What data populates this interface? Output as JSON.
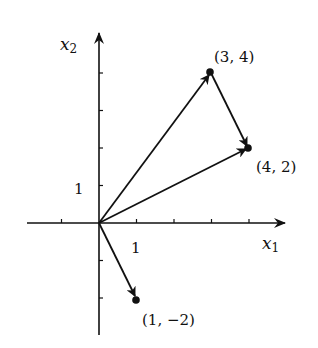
{
  "figure": {
    "axes": {
      "x_label": "x",
      "x_sub": "1",
      "y_label": "x",
      "y_sub": "2",
      "x_tick_label": "1",
      "y_tick_label": "1",
      "x_range": [
        -2,
        5
      ],
      "y_range": [
        -3,
        5
      ]
    },
    "points": [
      {
        "label": "(3, 4)",
        "x": 3,
        "y": 4
      },
      {
        "label": "(4, 2)",
        "x": 4,
        "y": 2
      },
      {
        "label": "(1, −2)",
        "x": 1,
        "y": -2
      }
    ],
    "vectors": [
      {
        "from": [
          0,
          0
        ],
        "to": [
          3,
          4
        ]
      },
      {
        "from": [
          0,
          0
        ],
        "to": [
          4,
          2
        ]
      },
      {
        "from": [
          3,
          4
        ],
        "to": [
          4,
          2
        ]
      },
      {
        "from": [
          0,
          0
        ],
        "to": [
          1,
          -2
        ]
      }
    ],
    "colors": {
      "ink": "#111111",
      "background": "#ffffff"
    }
  }
}
